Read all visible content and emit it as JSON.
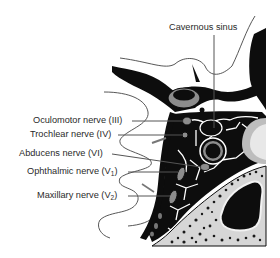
{
  "figure": {
    "type": "anatomical-diagram",
    "labels": [
      {
        "id": "cavernous-sinus",
        "text": "Cavernous sinus"
      },
      {
        "id": "oculomotor-nerve",
        "text": "Oculomotor nerve (III)"
      },
      {
        "id": "trochlear-nerve",
        "text": "Trochlear nerve (IV)"
      },
      {
        "id": "abducens-nerve",
        "text": "Abducens nerve (VI)"
      },
      {
        "id": "ophthalmic-nerve",
        "text": "Ophthalmic nerve (V",
        "sub": "1",
        "suffix": ")"
      },
      {
        "id": "maxillary-nerve",
        "text": "Maxillary nerve (V",
        "sub": "2",
        "suffix": ")"
      }
    ],
    "colors": {
      "background": "#ffffff",
      "structure_dark": "#0d0d0d",
      "structure_gray": "#8c8c8c",
      "bone_light": "#d6d6d6",
      "leader_line": "#555555",
      "outline": "#444444"
    }
  }
}
